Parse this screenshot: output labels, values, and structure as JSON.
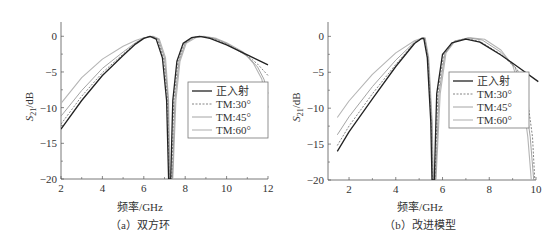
{
  "chart_data": [
    {
      "type": "line",
      "id": "a",
      "caption": "（a）双方环",
      "xlabel": "频率/GHz",
      "ylabel": "S21/dB",
      "xlim": [
        2,
        12
      ],
      "ylim": [
        -20,
        2
      ],
      "xticks": [
        2,
        4,
        6,
        8,
        10,
        12
      ],
      "yticks": [
        0,
        -5,
        -10,
        -15,
        -20
      ],
      "plot_box": {
        "left": 61,
        "right": 268,
        "top": 22,
        "bottom": 179
      },
      "legend": {
        "x": 188,
        "y": 82,
        "w": 80,
        "h": 56
      },
      "series": [
        {
          "name": "正入射",
          "color": "#222222",
          "width": 1.3,
          "dash": "",
          "x": [
            2,
            3,
            4,
            5,
            5.6,
            6,
            6.3,
            6.6,
            6.9,
            7.1,
            7.2,
            7.25,
            7.3,
            7.4,
            7.6,
            7.9,
            8.3,
            8.7,
            9.2,
            10,
            11,
            12
          ],
          "y": [
            -13,
            -9,
            -5.5,
            -2.7,
            -1.1,
            -0.3,
            0,
            -0.4,
            -3,
            -9,
            -20,
            -20,
            -20,
            -9,
            -3.5,
            -1,
            -0.2,
            0,
            -0.3,
            -1.2,
            -2.6,
            -4
          ]
        },
        {
          "name": "TM:30°",
          "color": "#777777",
          "width": 0.9,
          "dash": "2,1.5",
          "x": [
            2,
            3,
            4,
            5,
            5.6,
            6,
            6.35,
            6.65,
            6.95,
            7.15,
            7.22,
            7.28,
            7.35,
            7.45,
            7.65,
            7.95,
            8.35,
            8.75,
            9.3,
            10,
            11,
            11.5,
            12
          ],
          "y": [
            -12.3,
            -8.4,
            -5.1,
            -2.5,
            -1,
            -0.3,
            0,
            -0.4,
            -3,
            -9,
            -20,
            -20,
            -20,
            -9,
            -3.5,
            -1,
            -0.2,
            0,
            -0.3,
            -1.1,
            -2.7,
            -3.9,
            -5.5
          ]
        },
        {
          "name": "TM:45°",
          "color": "#9a9a9a",
          "width": 0.9,
          "dash": "",
          "x": [
            2,
            3,
            4,
            5,
            5.6,
            6,
            6.4,
            6.7,
            7.0,
            7.18,
            7.24,
            7.3,
            7.38,
            7.5,
            7.7,
            8.0,
            8.4,
            8.8,
            9.4,
            10,
            11,
            11.5,
            11.8,
            12
          ],
          "y": [
            -11.2,
            -7.6,
            -4.5,
            -2.2,
            -0.9,
            -0.25,
            0,
            -0.4,
            -3,
            -9,
            -20,
            -20,
            -20,
            -9,
            -3.5,
            -1,
            -0.2,
            0,
            -0.3,
            -1,
            -2.8,
            -4.3,
            -6,
            -8
          ]
        },
        {
          "name": "TM:60°",
          "color": "#b5b5b5",
          "width": 1.1,
          "dash": "",
          "x": [
            2,
            3,
            4,
            5,
            5.6,
            6,
            6.45,
            6.75,
            7.05,
            7.2,
            7.26,
            7.32,
            7.4,
            7.55,
            7.75,
            8.05,
            8.5,
            8.9,
            9.5,
            10,
            10.8,
            11.3,
            11.7,
            12
          ],
          "y": [
            -9.4,
            -5.8,
            -3.2,
            -1.4,
            -0.6,
            -0.2,
            0,
            -0.4,
            -3,
            -9,
            -20,
            -20,
            -20,
            -9,
            -3.5,
            -1,
            -0.2,
            0,
            -0.3,
            -0.9,
            -2.2,
            -3.8,
            -6,
            -10
          ]
        }
      ]
    },
    {
      "type": "line",
      "id": "b",
      "caption": "（b）改进模型",
      "xlabel": "频率/GHz",
      "ylabel": "S21/dB",
      "xlim": [
        1.1,
        10
      ],
      "ylim": [
        -20,
        2
      ],
      "xticks": [
        2,
        4,
        6,
        8,
        10
      ],
      "yticks": [
        0,
        -5,
        -10,
        -15,
        -20
      ],
      "plot_box": {
        "left": 328,
        "right": 536,
        "top": 22,
        "bottom": 180
      },
      "legend": {
        "x": 449,
        "y": 72,
        "w": 80,
        "h": 56
      },
      "series": [
        {
          "name": "正入射",
          "color": "#222222",
          "width": 1.3,
          "dash": "",
          "x": [
            1.5,
            2,
            3,
            4,
            4.8,
            5.1,
            5.2,
            5.35,
            5.5,
            5.55,
            5.6,
            5.65,
            5.75,
            6,
            6.4,
            7,
            7.6,
            8.5,
            9.2,
            10.1
          ],
          "y": [
            -16,
            -13.3,
            -8.7,
            -4.2,
            -1,
            -0.3,
            -0.3,
            -3,
            -12,
            -20,
            -20,
            -20,
            -8,
            -2.5,
            -0.9,
            -0.4,
            -0.8,
            -2.6,
            -4.2,
            -6.3
          ]
        },
        {
          "name": "TM:30°",
          "color": "#777777",
          "width": 0.9,
          "dash": "2,1.5",
          "x": [
            1.5,
            2,
            3,
            4,
            4.8,
            5.12,
            5.22,
            5.37,
            5.52,
            5.57,
            5.62,
            5.68,
            5.8,
            6.05,
            6.45,
            7,
            7.6,
            8.5,
            9.2,
            9.6,
            9.85,
            9.95
          ],
          "y": [
            -15.2,
            -12.5,
            -8,
            -3.9,
            -0.9,
            -0.3,
            -0.3,
            -3,
            -12,
            -20,
            -20,
            -20,
            -8,
            -2.5,
            -0.8,
            -0.3,
            -0.7,
            -2.5,
            -4.6,
            -8,
            -14,
            -20
          ]
        },
        {
          "name": "TM:45°",
          "color": "#9a9a9a",
          "width": 0.9,
          "dash": "",
          "x": [
            1.5,
            2,
            3,
            4,
            4.8,
            5.14,
            5.24,
            5.39,
            5.54,
            5.59,
            5.64,
            5.7,
            5.85,
            6.1,
            6.5,
            7.1,
            7.7,
            8.5,
            9.1,
            9.5,
            9.75,
            9.9
          ],
          "y": [
            -13.7,
            -11.2,
            -7,
            -3.3,
            -0.8,
            -0.25,
            -0.25,
            -3,
            -12,
            -20,
            -20,
            -20,
            -8,
            -2.4,
            -0.7,
            -0.2,
            -0.5,
            -2.2,
            -4.3,
            -8,
            -14,
            -20
          ]
        },
        {
          "name": "TM:60°",
          "color": "#b5b5b5",
          "width": 1.1,
          "dash": "",
          "x": [
            1.5,
            2,
            3,
            4,
            4.8,
            5.16,
            5.26,
            5.41,
            5.56,
            5.61,
            5.66,
            5.72,
            5.9,
            6.15,
            6.55,
            7.2,
            7.8,
            8.5,
            9.0,
            9.4,
            9.65,
            9.8
          ],
          "y": [
            -11.3,
            -9,
            -5.3,
            -2.3,
            -0.6,
            -0.2,
            -0.2,
            -3,
            -12,
            -20,
            -20,
            -20,
            -8,
            -2.3,
            -0.6,
            -0.2,
            -0.4,
            -1.9,
            -4,
            -8,
            -14,
            -20
          ]
        }
      ]
    }
  ]
}
